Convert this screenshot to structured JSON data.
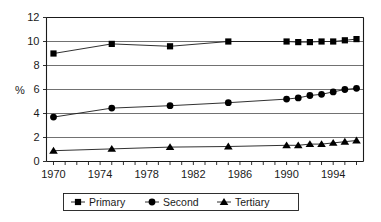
{
  "chart_data": {
    "type": "line",
    "title": "",
    "xlabel": "",
    "ylabel": "%",
    "xlim": [
      1969.4,
      1996.6
    ],
    "ylim": [
      0,
      12
    ],
    "grid": true,
    "legend_position": "bottom",
    "x_tick_labels": [
      "1970",
      "1974",
      "1978",
      "1982",
      "1986",
      "1990",
      "1994"
    ],
    "x_tick_values": [
      1970,
      1974,
      1978,
      1982,
      1986,
      1990,
      1994
    ],
    "x_minor_ticks": [
      1970,
      1971,
      1972,
      1973,
      1974,
      1975,
      1976,
      1977,
      1978,
      1979,
      1980,
      1981,
      1982,
      1983,
      1984,
      1985,
      1986,
      1987,
      1988,
      1989,
      1990,
      1991,
      1992,
      1993,
      1994,
      1995,
      1996
    ],
    "y_tick_labels": [
      "0",
      "2",
      "4",
      "6",
      "8",
      "10",
      "12"
    ],
    "y_tick_values": [
      0,
      2,
      4,
      6,
      8,
      10,
      12
    ],
    "x": [
      1970,
      1975,
      1980,
      1985,
      1990,
      1991,
      1992,
      1993,
      1994,
      1995,
      1996
    ],
    "series": [
      {
        "name": "Primary",
        "marker": "square",
        "values": [
          9.0,
          9.8,
          9.6,
          10.0,
          10.0,
          9.95,
          9.95,
          10.0,
          10.0,
          10.1,
          10.2
        ]
      },
      {
        "name": "Second",
        "marker": "circle",
        "values": [
          3.7,
          4.45,
          4.65,
          4.9,
          5.2,
          5.3,
          5.5,
          5.6,
          5.8,
          6.0,
          6.1
        ]
      },
      {
        "name": "Tertiary",
        "marker": "triangle",
        "values": [
          0.9,
          1.05,
          1.2,
          1.25,
          1.35,
          1.35,
          1.45,
          1.45,
          1.55,
          1.65,
          1.75
        ]
      }
    ]
  },
  "legend": {
    "entries": [
      {
        "label": "Primary"
      },
      {
        "label": "Second"
      },
      {
        "label": "Tertiary"
      }
    ]
  },
  "axes": {
    "y_axis_title": "%"
  },
  "colors": {
    "marker": "#000000",
    "line": "#1a1a1a",
    "grid": "#4d4d4d",
    "axis": "#1a1a1a",
    "background": "#ffffff"
  }
}
